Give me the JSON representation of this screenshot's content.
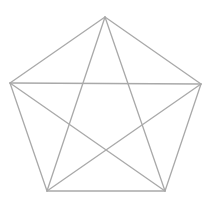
{
  "diagram": {
    "type": "complete-graph-K5",
    "stroke_color": "#a9a9a9",
    "background": "#ffffff",
    "vertices": [
      {
        "id": "top",
        "x": 105,
        "y": 17
      },
      {
        "id": "right",
        "x": 201,
        "y": 84
      },
      {
        "id": "bottom-right",
        "x": 165,
        "y": 191
      },
      {
        "id": "bottom-left",
        "x": 47,
        "y": 191
      },
      {
        "id": "left",
        "x": 10,
        "y": 83
      }
    ]
  }
}
